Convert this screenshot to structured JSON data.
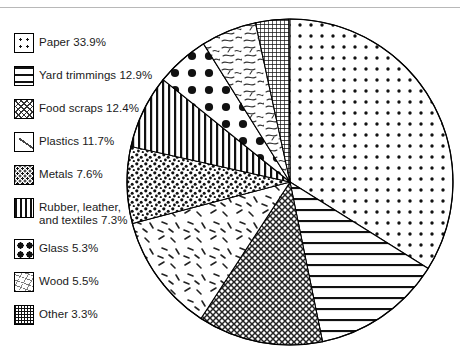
{
  "figure": {
    "name": "msw-composition-pie-chart",
    "background_color": "#ffffff",
    "line_color": "#000000",
    "rule_color": "#b8b8b8"
  },
  "legend": {
    "items": [
      {
        "label": "Paper 33.9%",
        "pattern": "fine-dot-grid",
        "value": 33.9,
        "category": "Paper"
      },
      {
        "label": "Yard trimmings 12.9%",
        "pattern": "horizontal-lines",
        "value": 12.9,
        "category": "Yard trimmings"
      },
      {
        "label": "Food scraps 12.4%",
        "pattern": "crosshatch-diagonal",
        "value": 12.4,
        "category": "Food scraps"
      },
      {
        "label": "Plastics 11.7%",
        "pattern": "sparse-dashes",
        "value": 11.7,
        "category": "Plastics"
      },
      {
        "label": "Metals 7.6%",
        "pattern": "coarse-speckle",
        "value": 7.6,
        "category": "Metals"
      },
      {
        "label": "Rubber, leather,\nand textiles 7.3%",
        "pattern": "vertical-lines",
        "value": 7.3,
        "category": "Rubber, leather, and textiles"
      },
      {
        "label": "Glass 5.3%",
        "pattern": "large-dots",
        "value": 5.3,
        "category": "Glass"
      },
      {
        "label": "Wood 5.5%",
        "pattern": "scribble-strokes",
        "value": 5.5,
        "category": "Wood"
      },
      {
        "label": "Other 3.3%",
        "pattern": "dense-crosshatch",
        "value": 3.3,
        "category": "Other"
      }
    ]
  },
  "chart_data": {
    "type": "pie",
    "title": "",
    "subtitle": "",
    "xlabel": "",
    "ylabel": "",
    "legend_position": "left",
    "grid": false,
    "units": "percent",
    "total": 99.9,
    "start_angle_deg": 0,
    "direction": "clockwise",
    "center": {
      "x": 290,
      "y": 182
    },
    "radius": 163,
    "categories": [
      "Paper",
      "Yard trimmings",
      "Food scraps",
      "Plastics",
      "Metals",
      "Rubber, leather, and textiles",
      "Glass",
      "Wood",
      "Other"
    ],
    "values": [
      33.9,
      12.9,
      12.4,
      11.7,
      7.6,
      7.3,
      5.3,
      5.5,
      3.3
    ],
    "labels": [
      "Paper 33.9%",
      "Yard trimmings 12.9%",
      "Food scraps 12.4%",
      "Plastics 11.7%",
      "Metals 7.6%",
      "Rubber, leather, and textiles 7.3%",
      "Glass 5.3%",
      "Wood 5.5%",
      "Other 3.3%"
    ],
    "patterns": [
      "fine-dot-grid",
      "horizontal-lines",
      "crosshatch-diagonal",
      "sparse-dashes",
      "coarse-speckle",
      "vertical-lines",
      "large-dots",
      "scribble-strokes",
      "dense-crosshatch"
    ],
    "slices": [
      {
        "category": "Paper",
        "value": 33.9,
        "pattern": "fine-dot-grid",
        "start_deg": 0.0,
        "end_deg": 122.04
      },
      {
        "category": "Yard trimmings",
        "value": 12.9,
        "pattern": "horizontal-lines",
        "start_deg": 122.04,
        "end_deg": 168.48
      },
      {
        "category": "Food scraps",
        "value": 12.4,
        "pattern": "crosshatch-diagonal",
        "start_deg": 168.48,
        "end_deg": 213.12
      },
      {
        "category": "Plastics",
        "value": 11.7,
        "pattern": "sparse-dashes",
        "start_deg": 213.12,
        "end_deg": 255.24
      },
      {
        "category": "Metals",
        "value": 7.6,
        "pattern": "coarse-speckle",
        "start_deg": 255.24,
        "end_deg": 282.6
      },
      {
        "category": "Rubber, leather, and textiles",
        "value": 7.3,
        "pattern": "vertical-lines",
        "start_deg": 282.6,
        "end_deg": 308.88
      },
      {
        "category": "Glass",
        "value": 5.3,
        "pattern": "large-dots",
        "start_deg": 308.88,
        "end_deg": 327.96
      },
      {
        "category": "Wood",
        "value": 5.5,
        "pattern": "scribble-strokes",
        "start_deg": 327.96,
        "end_deg": 347.76
      },
      {
        "category": "Other",
        "value": 3.3,
        "pattern": "dense-crosshatch",
        "start_deg": 347.76,
        "end_deg": 359.64
      }
    ]
  }
}
